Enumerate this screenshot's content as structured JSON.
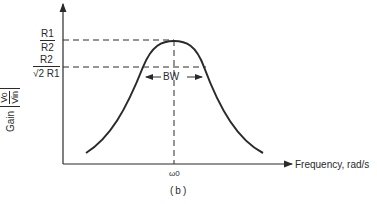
{
  "figure": {
    "caption": "(b)",
    "y_axis": {
      "label_word": "Gain",
      "ratio_num": "Vo",
      "ratio_den": "Vin"
    },
    "x_axis": {
      "label": "Frequency, rad/s",
      "tick": "ω0"
    },
    "levels": [
      {
        "num": "R1",
        "den": "R2",
        "meaning": "peak gain"
      },
      {
        "num": "R2",
        "den": "√2 R1",
        "meaning": "half-power gain"
      }
    ],
    "bandwidth_label": "BW",
    "colors": {
      "ink": "#2a2a2a",
      "background": "#ffffff"
    }
  }
}
